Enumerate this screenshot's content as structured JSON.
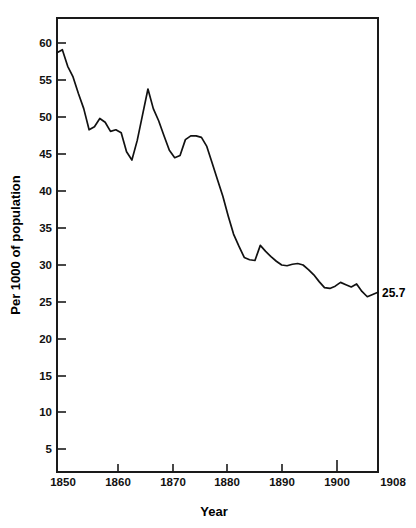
{
  "chart_data": {
    "type": "line",
    "title": "",
    "xlabel": "Year",
    "ylabel": "Per 1000 of population",
    "xlim": [
      1848,
      1908
    ],
    "ylim": [
      1.9,
      62.0
    ],
    "grid": false,
    "legend": null,
    "yticks": [
      5,
      10,
      15,
      20,
      25,
      30,
      35,
      40,
      45,
      50,
      55,
      60
    ],
    "ytick_labels": [
      "5",
      "10",
      "15",
      "20",
      "25",
      "30",
      "35",
      "40",
      "45",
      "50",
      "55",
      "60"
    ],
    "xticks": [
      1850,
      1860,
      1870,
      1880,
      1890,
      1900,
      1908
    ],
    "xtick_labels": [
      "1850",
      "1860",
      "1870",
      "1880",
      "1890",
      "1900",
      "1908"
    ],
    "annotations": [
      {
        "text": "25.7",
        "x": 1908,
        "y": 25.7,
        "position": "right-of-axis"
      }
    ],
    "series": [
      {
        "name": "Birth rate per 1000 of population",
        "x": [
          1848,
          1849,
          1850,
          1851,
          1852,
          1853,
          1854,
          1855,
          1856,
          1857,
          1858,
          1859,
          1860,
          1861,
          1862,
          1863,
          1864,
          1865,
          1866,
          1867,
          1868,
          1869,
          1870,
          1871,
          1872,
          1873,
          1874,
          1875,
          1876,
          1877,
          1878,
          1879,
          1880,
          1881,
          1882,
          1883,
          1884,
          1885,
          1886,
          1887,
          1888,
          1889,
          1890,
          1891,
          1892,
          1893,
          1894,
          1895,
          1896,
          1897,
          1898,
          1899,
          1900,
          1901,
          1902,
          1903,
          1904,
          1905,
          1906,
          1907,
          1908
        ],
        "y": [
          57.4,
          57.8,
          55.6,
          54.2,
          52.0,
          50.0,
          47.2,
          47.6,
          48.7,
          48.2,
          47.0,
          47.2,
          46.8,
          44.3,
          43.2,
          45.8,
          49.2,
          52.6,
          50.0,
          48.4,
          46.4,
          44.5,
          43.5,
          43.8,
          45.9,
          46.4,
          46.4,
          46.2,
          45.0,
          42.8,
          40.6,
          38.4,
          35.8,
          33.4,
          31.8,
          30.3,
          30.0,
          29.9,
          31.9,
          31.1,
          30.4,
          29.8,
          29.3,
          29.2,
          29.4,
          29.5,
          29.3,
          28.7,
          28.0,
          27.1,
          26.3,
          26.2,
          26.5,
          27.0,
          26.7,
          26.4,
          26.8,
          25.8,
          25.1,
          25.4,
          25.7
        ]
      }
    ]
  },
  "axis": {
    "y_title": "Per 1000 of population",
    "x_title": "Year",
    "end_value_label": "25.7"
  }
}
